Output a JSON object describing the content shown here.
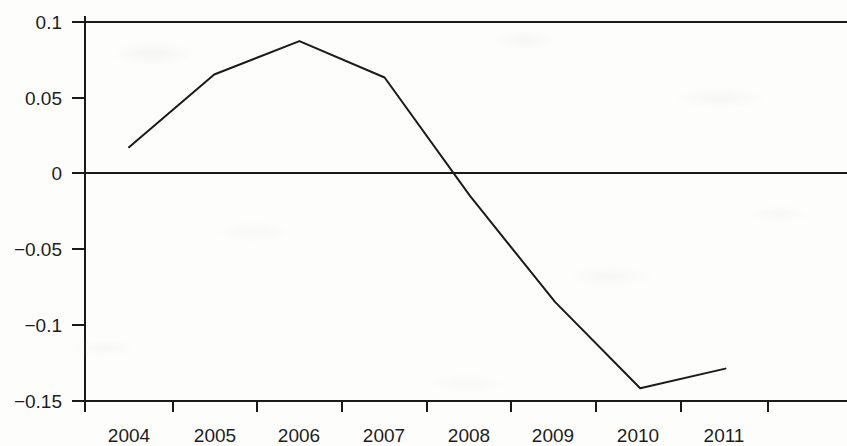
{
  "chart_data": {
    "type": "line",
    "title": "",
    "subtitle": "",
    "xlabel": "",
    "ylabel": "",
    "categories": [
      "2004",
      "2005",
      "2006",
      "2007",
      "2008",
      "2009",
      "2010",
      "2011"
    ],
    "x": [
      2004,
      2005,
      2006,
      2007,
      2008,
      2009,
      2010,
      2011
    ],
    "values": [
      0.017,
      0.065,
      0.087,
      0.063,
      -0.015,
      -0.085,
      -0.142,
      -0.129
    ],
    "series": [
      {
        "name": "series-1",
        "values": [
          0.017,
          0.065,
          0.087,
          0.063,
          -0.015,
          -0.085,
          -0.142,
          -0.129
        ],
        "color": "#1a1a1a",
        "line_width": 2
      }
    ],
    "ylim": [
      -0.15,
      0.1
    ],
    "yticks": [
      0.1,
      0.05,
      0,
      -0.05,
      -0.1,
      -0.15
    ],
    "ytick_labels": [
      "0.1",
      "0.05",
      "0",
      "−0.05",
      "−0.1",
      "−0.15"
    ],
    "xtick_labels": [
      "2004",
      "2005",
      "2006",
      "2007",
      "2008",
      "2009",
      "2010",
      "2011"
    ],
    "grid": false,
    "zero_line": true,
    "zero_line_value": 0,
    "legend": "none",
    "legend_position": "none",
    "annotations": [],
    "axis_color": "#1a1a1a",
    "background_color": "#fdfdfc"
  },
  "axes": {
    "y_axis_name": "value-axis",
    "x_axis_name": "year-axis"
  }
}
